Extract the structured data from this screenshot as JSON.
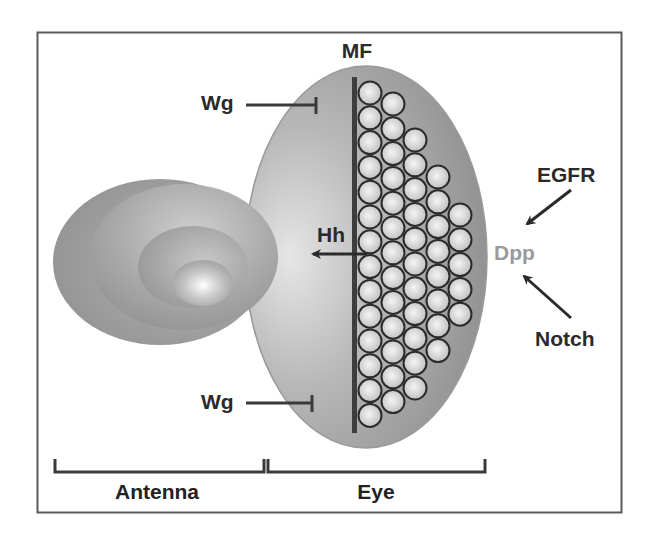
{
  "figure": {
    "type": "schematic",
    "colors": {
      "frame": "#5a5a5a",
      "tissue_dark": "#8c8c8c",
      "tissue_mid": "#a8a8a8",
      "tissue_light": "#e4e4e4",
      "furrow": "#3d3d3d",
      "ommatidium_fill": "#dcdcdc",
      "ommatidium_stroke": "#2b2b2b",
      "arrow": "#2a2a2a",
      "dpp_text": "#9a9a9a",
      "text": "#2a2a2a"
    }
  },
  "labels": {
    "mf": "MF",
    "wg_top": "Wg",
    "wg_bottom": "Wg",
    "hh": "Hh",
    "egfr": "EGFR",
    "dpp": "Dpp",
    "notch": "Notch"
  },
  "regions": {
    "antenna": "Antenna",
    "eye": "Eye"
  },
  "interactions": [
    {
      "from": "Wg",
      "to": "MF (top)",
      "type": "inhibition"
    },
    {
      "from": "Wg",
      "to": "MF (bottom)",
      "type": "inhibition"
    },
    {
      "from": "MF",
      "to": "Hh",
      "type": "activation",
      "direction": "anterior"
    },
    {
      "from": "EGFR",
      "to": "Dpp",
      "type": "activation"
    },
    {
      "from": "Notch",
      "to": "Dpp",
      "type": "activation"
    }
  ],
  "ommatidia_columns": [
    {
      "column": 1,
      "count": 14
    },
    {
      "column": 2,
      "count": 13
    },
    {
      "column": 3,
      "count": 11
    },
    {
      "column": 4,
      "count": 8
    },
    {
      "column": 5,
      "count": 5
    }
  ]
}
